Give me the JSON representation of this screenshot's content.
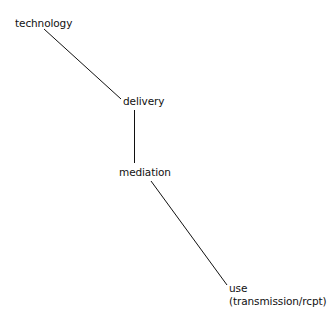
{
  "diagram": {
    "nodes": [
      {
        "id": "technology",
        "label": "technology"
      },
      {
        "id": "delivery",
        "label": "delivery"
      },
      {
        "id": "mediation",
        "label": "mediation"
      },
      {
        "id": "use",
        "label": "use",
        "sublabel": "(transmission/rcpt)"
      }
    ],
    "edges": [
      {
        "from": "technology",
        "to": "delivery"
      },
      {
        "from": "delivery",
        "to": "mediation"
      },
      {
        "from": "mediation",
        "to": "use"
      }
    ],
    "line_color": "#111111"
  }
}
